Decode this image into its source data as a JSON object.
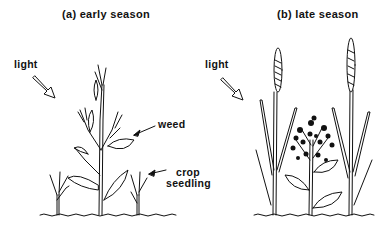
{
  "panels": [
    {
      "id": "a",
      "title": "(a) early season",
      "light_label": "light",
      "annotations": [
        {
          "label": "weed"
        },
        {
          "label_line1": "crop",
          "label_line2": "seedling"
        }
      ]
    },
    {
      "id": "b",
      "title": "(b) late season",
      "light_label": "light"
    }
  ]
}
